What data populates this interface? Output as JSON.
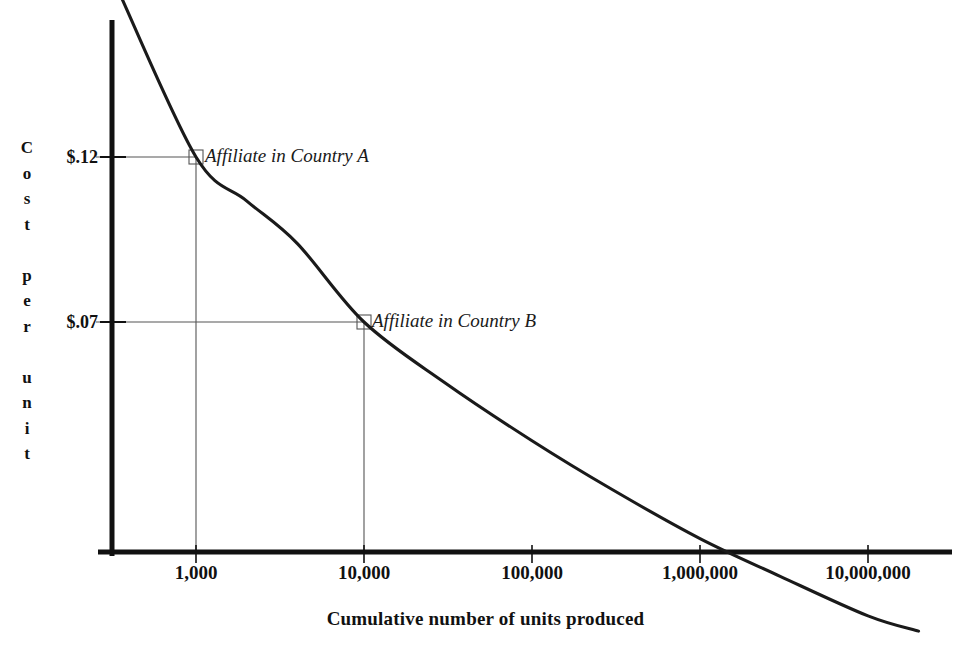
{
  "chart_data": {
    "type": "line",
    "title": "",
    "subtitle": "",
    "xlabel": "Cumulative number of units produced",
    "ylabel": "Cost per unit",
    "xscale": "log",
    "x_tick_labels": [
      "1,000",
      "10,000",
      "100,000",
      "1,000,000",
      "10,000,000"
    ],
    "x_tick_values": [
      1000,
      10000,
      100000,
      1000000,
      10000000
    ],
    "y_tick_labels": [
      "$.12",
      "$.07"
    ],
    "y_tick_values": [
      0.12,
      0.07
    ],
    "grid": false,
    "legend": "none",
    "series": [
      {
        "name": "Experience curve",
        "x": [
          350,
          1000,
          2000,
          4000,
          10000,
          30000,
          100000,
          300000,
          1000000,
          3000000,
          10000000,
          20000000
        ],
        "y": [
          0.205,
          0.12,
          0.104,
          0.0905,
          0.07,
          0.0575,
          0.0475,
          0.0405,
          0.0345,
          0.0305,
          0.0268,
          0.0255
        ]
      }
    ],
    "annotations": [
      {
        "label": "Affiliate in Country A",
        "x": 1000,
        "y": 0.12,
        "marker": "square"
      },
      {
        "label": "Affiliate in Country B",
        "x": 10000,
        "y": 0.07,
        "marker": "square"
      }
    ],
    "ylabel_letters": [
      "C",
      "o",
      "s",
      "t",
      "",
      "p",
      "e",
      "r",
      "",
      "u",
      "n",
      "i",
      "t"
    ]
  },
  "axis": {
    "x_title": "Cumulative number of units produced",
    "y_title": "Cost per unit",
    "x_ticks": [
      "1,000",
      "10,000",
      "100,000",
      "1,000,000",
      "10,000,000"
    ],
    "y_ticks": [
      "$.12",
      "$.07"
    ]
  },
  "annotations": {
    "country_a": "Affiliate in Country A",
    "country_b": "Affiliate in Country B"
  },
  "colors": {
    "axis": "#111111",
    "curve": "#1a1a1a",
    "guide_line": "#555555",
    "background": "#ffffff"
  }
}
